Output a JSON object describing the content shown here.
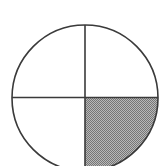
{
  "figure": {
    "name": "quartered-circle-with-one-shaded-quadrant",
    "canvas": {
      "width": 168,
      "height": 166,
      "background_color": "#ffffff"
    },
    "circle": {
      "center_x": 85,
      "center_y": 98,
      "radius": 73,
      "stroke_color": "#3a3a3a",
      "stroke_width": 1.6,
      "fill_color": "#ffffff",
      "clipped_at_bottom": "true"
    },
    "divider_lines": [
      {
        "name": "vertical-diameter",
        "orientation": "vertical",
        "x": 85,
        "y_start": 25,
        "y_end": 166,
        "stroke_color": "#3a3a3a",
        "stroke_width": 1.6
      },
      {
        "name": "horizontal-diameter",
        "orientation": "horizontal",
        "y": 97,
        "x_start": 12,
        "x_end": 158,
        "stroke_color": "#3a3a3a",
        "stroke_width": 1.6
      }
    ],
    "quadrants": [
      {
        "name": "top-left-quadrant",
        "position": "top-left",
        "shaded": "false",
        "fill_color": "#ffffff",
        "fraction": "1/4"
      },
      {
        "name": "top-right-quadrant",
        "position": "top-right",
        "shaded": "false",
        "fill_color": "#ffffff",
        "fraction": "1/4"
      },
      {
        "name": "bottom-left-quadrant",
        "position": "bottom-left",
        "shaded": "false",
        "fill_color": "#ffffff",
        "fraction": "1/4"
      },
      {
        "name": "bottom-right-quadrant",
        "position": "bottom-right",
        "shaded": "true",
        "fill_color": "#9a9a9a",
        "pattern": "checkerboard-dither",
        "pattern_dot_color": "#767676",
        "pattern_background_color": "#b5b5b5",
        "fraction": "1/4"
      }
    ],
    "shaded_count": 1,
    "total_parts": 4,
    "shaded_fraction_label": "1/4"
  }
}
